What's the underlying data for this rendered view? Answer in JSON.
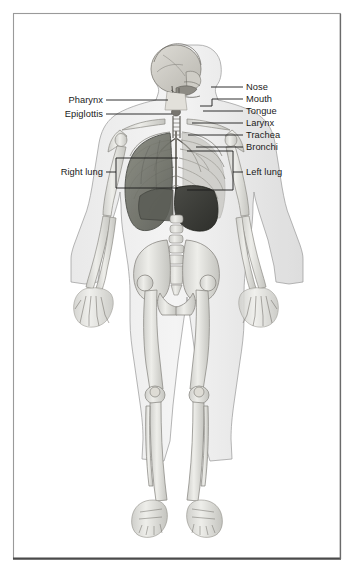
{
  "figure": {
    "view": "anterior full-body skeleton with respiratory organs",
    "border_color": "#9a9a9a",
    "border_bottom_color": "#4a4a4a",
    "background_color": "#ffffff",
    "line_color": "#1a1a1a",
    "text_color": "#1a1a1a"
  },
  "labels_right": [
    {
      "id": "nose",
      "text": "Nose",
      "x": 246,
      "y": 83,
      "leader_x1": 211,
      "leader_x2": 243,
      "leader_y": 87
    },
    {
      "id": "mouth",
      "text": "Mouth",
      "x": 246,
      "y": 95,
      "leader_x1": 200,
      "leader_x2": 243,
      "leader_y": 99
    },
    {
      "id": "tongue",
      "text": "Tongue",
      "x": 246,
      "y": 107,
      "leader_x1": 203,
      "leader_x2": 243,
      "leader_y": 111
    },
    {
      "id": "larynx",
      "text": "Larynx",
      "x": 246,
      "y": 119,
      "leader_x1": 192,
      "leader_x2": 243,
      "leader_y": 123
    },
    {
      "id": "trachea",
      "text": "Trachea",
      "x": 246,
      "y": 131,
      "leader_x1": 188,
      "leader_x2": 243,
      "leader_y": 135
    },
    {
      "id": "bronchi",
      "text": "Bronchi",
      "x": 246,
      "y": 143,
      "leader_x1": 196,
      "leader_x2": 243,
      "leader_y": 147
    },
    {
      "id": "left-lung",
      "text": "Left lung",
      "x": 246,
      "y": 168,
      "leader_x1": 233,
      "leader_x2": 243,
      "leader_y": 172
    }
  ],
  "labels_left": [
    {
      "id": "pharynx",
      "text": "Pharynx",
      "x": 58,
      "y": 96,
      "leader_x1": 106,
      "leader_x2": 165,
      "leader_y": 100
    },
    {
      "id": "epiglottis",
      "text": "Epiglottis",
      "x": 48,
      "y": 110,
      "leader_x1": 106,
      "leader_x2": 170,
      "leader_y": 114
    },
    {
      "id": "right-lung",
      "text": "Right lung",
      "x": 46,
      "y": 168,
      "leader_x1": 106,
      "leader_x2": 116,
      "leader_y": 172
    }
  ],
  "brackets": {
    "left_lung": {
      "x_left": 187,
      "x_right": 233,
      "y_top": 151,
      "y_bottom": 190,
      "stem_y": 172
    },
    "right_lung": {
      "x_left": 116,
      "x_right": 178,
      "y_top": 158,
      "y_bottom": 188,
      "stem_y": 172
    }
  },
  "mouth_leader_jog": {
    "x_start": 200,
    "y_start": 106,
    "x_corner": 212,
    "y_corner": 99
  },
  "anatomy_regions": [
    {
      "id": "skull",
      "name": "Skull / cranium (sagittal section)"
    },
    {
      "id": "cervical-spine",
      "name": "Cervical vertebrae"
    },
    {
      "id": "clavicle",
      "name": "Clavicles"
    },
    {
      "id": "scapula",
      "name": "Scapulae"
    },
    {
      "id": "ribcage",
      "name": "Rib cage"
    },
    {
      "id": "sternum",
      "name": "Sternum"
    },
    {
      "id": "right-lung",
      "name": "Right lung (shaded dark)"
    },
    {
      "id": "left-lung",
      "name": "Left lung (rib-overlay)"
    },
    {
      "id": "liver",
      "name": "Liver (dark organ below lungs)"
    },
    {
      "id": "lumbar-spine",
      "name": "Lumbar vertebrae"
    },
    {
      "id": "pelvis",
      "name": "Pelvis / ilium / sacrum"
    },
    {
      "id": "humerus",
      "name": "Humerus (upper arms)"
    },
    {
      "id": "radius-ulna",
      "name": "Radius and ulna (forearms)"
    },
    {
      "id": "hands",
      "name": "Hands - carpals, metacarpals, phalanges"
    },
    {
      "id": "femur",
      "name": "Femurs (thighs)"
    },
    {
      "id": "patella",
      "name": "Patellae (kneecaps)"
    },
    {
      "id": "tibia-fibula",
      "name": "Tibia and fibula (lower legs)"
    },
    {
      "id": "feet",
      "name": "Feet - tarsals, metatarsals, phalanges"
    }
  ]
}
